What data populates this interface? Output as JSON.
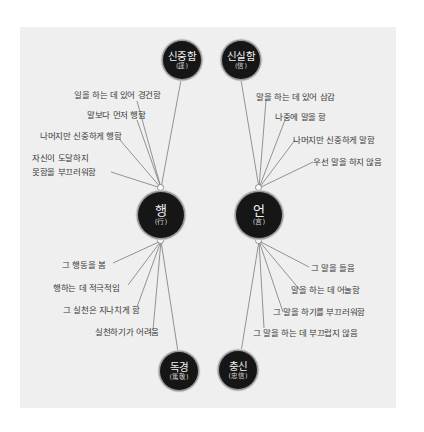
{
  "diagram": {
    "colors": {
      "background": "#efefef",
      "node_fill": "#161616",
      "node_text": "#f2f2f2",
      "line": "#7a7a7a",
      "label_text": "#3a3a3a"
    },
    "center_nodes": [
      {
        "id": "haeng",
        "label": "행",
        "hanja": "(行)"
      },
      {
        "id": "eon",
        "label": "언",
        "hanja": "(言)"
      }
    ],
    "outer_nodes": [
      {
        "id": "sinjungham",
        "label": "신중함",
        "hanja": "(謹)",
        "links_to": "haeng"
      },
      {
        "id": "sinsilham",
        "label": "신실함",
        "hanja": "(信)",
        "links_to": "eon"
      },
      {
        "id": "dokgyeong",
        "label": "독경",
        "hanja": "(篤敬)",
        "links_to": "haeng"
      },
      {
        "id": "chungsin",
        "label": "충신",
        "hanja": "(忠信)",
        "links_to": "eon"
      }
    ],
    "branches": {
      "haeng_top": [
        "일을 하는 데 있어 경건함",
        "말보다 먼저 행함",
        "나머지만 신중하게 행함",
        "자신이 도달하지",
        "못함을 부끄러워함"
      ],
      "eon_top": [
        "말을 하는 데 있어 삼감",
        "나중에 말을 함",
        "나머지만 신중하게 말함",
        "우선 말을 하지 않음"
      ],
      "haeng_bottom": [
        "그 행동을 봄",
        "행하는 데 적극적임",
        "그 실천은 지나치게 함",
        "실천하기가 어려움"
      ],
      "eon_bottom": [
        "그 말을 들음",
        "말을 하는 데 어눌함",
        "그 말을 하기를 부끄러워함",
        "그 말을 하는 데 부끄럽지 않음"
      ]
    }
  }
}
